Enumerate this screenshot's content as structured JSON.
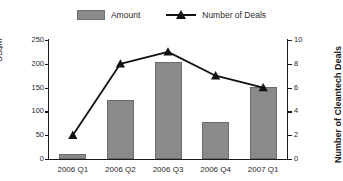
{
  "chart_data": {
    "type": "bar",
    "title": "",
    "subtitle": "",
    "categories": [
      "2006 Q1",
      "2006 Q2",
      "2006 Q3",
      "2006 Q4",
      "2007 Q1"
    ],
    "series": [
      {
        "name": "Amount",
        "type": "bar",
        "axis": "left",
        "values": [
          10,
          124,
          204,
          78,
          151
        ],
        "color": "#8a8a8a"
      },
      {
        "name": "Number of Deals",
        "type": "line",
        "axis": "right",
        "values": [
          2,
          8,
          9,
          7,
          6
        ],
        "color": "#111111",
        "marker": "triangle"
      }
    ],
    "xlabel": "",
    "ylabel": "US$M",
    "y2label": "Number of Cleantech Deals",
    "ylim": [
      0,
      250
    ],
    "y2lim": [
      0,
      10
    ],
    "yticks": [
      0,
      50,
      100,
      150,
      200,
      250
    ],
    "y2ticks": [
      0,
      2,
      4,
      6,
      8,
      10
    ],
    "grid": false,
    "legend_position": "top-center"
  },
  "legend": {
    "items": [
      {
        "label": "Amount",
        "swatch": "bar-swatch-icon"
      },
      {
        "label": "Number of Deals",
        "swatch": "line-marker-icon"
      }
    ]
  },
  "axes": {
    "left_title": "US$M",
    "right_title": "Number of Cleantech Deals",
    "left_ticks": [
      "250",
      "200",
      "150",
      "100",
      "50",
      "0"
    ],
    "right_ticks": [
      "10",
      "8",
      "6",
      "4",
      "2",
      "0"
    ]
  },
  "categories": [
    "2006 Q1",
    "2006 Q2",
    "2006 Q3",
    "2006 Q4",
    "2007 Q1"
  ]
}
